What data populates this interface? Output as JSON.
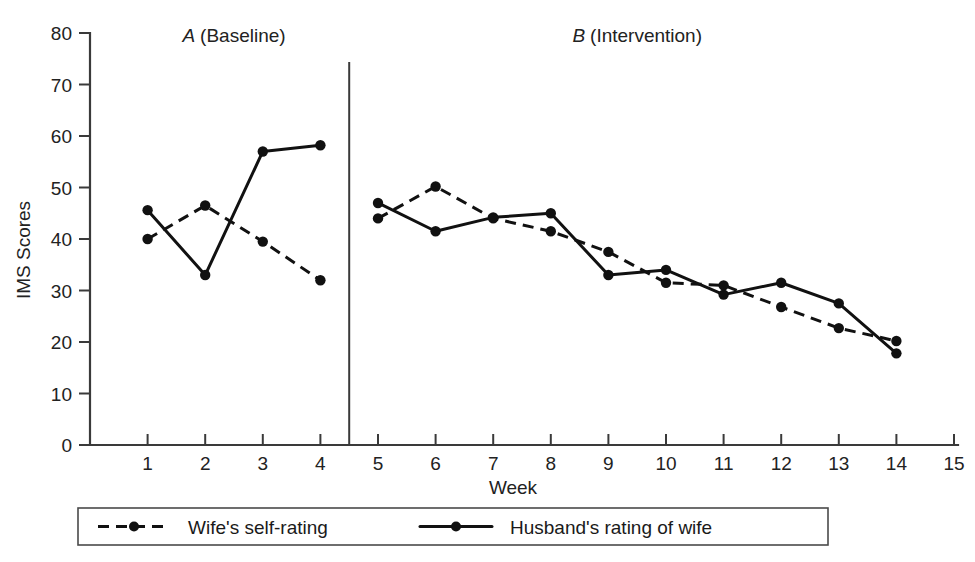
{
  "chart_data": {
    "type": "line",
    "title": "",
    "xlabel": "Week",
    "ylabel": "IMS Scores",
    "xlim": [
      0,
      15
    ],
    "ylim": [
      0,
      80
    ],
    "grid": false,
    "legend_position": "bottom",
    "x_ticks": [
      "1",
      "2",
      "3",
      "4",
      "5",
      "6",
      "7",
      "8",
      "9",
      "10",
      "11",
      "12",
      "13",
      "14",
      "15"
    ],
    "y_ticks": [
      "0",
      "10",
      "20",
      "30",
      "40",
      "50",
      "60",
      "70",
      "80"
    ],
    "x": [
      1,
      2,
      3,
      4,
      5,
      6,
      7,
      8,
      9,
      10,
      11,
      12,
      13,
      14
    ],
    "phases": [
      {
        "id": "A",
        "letter": "A",
        "name": "(Baseline)",
        "start": 1,
        "end": 4
      },
      {
        "id": "B",
        "letter": "B",
        "name": "(Intervention)",
        "start": 5,
        "end": 14
      }
    ],
    "phase_change_x": 4.5,
    "series": [
      {
        "name": "Wife's self-rating",
        "style": "dashed",
        "marker": "circle",
        "values": [
          40,
          46.5,
          39.5,
          32,
          44,
          50.2,
          44,
          41.5,
          37.5,
          31.5,
          31,
          26.8,
          22.7,
          20.2
        ]
      },
      {
        "name": "Husband's rating of wife",
        "style": "solid",
        "marker": "circle",
        "values": [
          45.6,
          33,
          57,
          58.2,
          47,
          41.5,
          44.2,
          45,
          33,
          34,
          29.2,
          31.5,
          27.5,
          17.8
        ]
      }
    ]
  },
  "legend": {
    "items": [
      {
        "label": "Wife's self-rating",
        "style": "dashed"
      },
      {
        "label": "Husband's rating of wife",
        "style": "solid"
      }
    ]
  }
}
